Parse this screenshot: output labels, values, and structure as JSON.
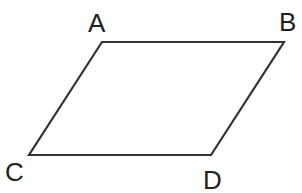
{
  "diagram": {
    "type": "parallelogram",
    "stroke_color": "#333333",
    "label_color": "#222222",
    "vertices": [
      {
        "name": "A",
        "x": 102,
        "y": 42,
        "label_x": 88,
        "label_y": 32
      },
      {
        "name": "B",
        "x": 284,
        "y": 42,
        "label_x": 279,
        "label_y": 31
      },
      {
        "name": "D",
        "x": 211,
        "y": 155,
        "label_x": 203,
        "label_y": 189
      },
      {
        "name": "C",
        "x": 29,
        "y": 155,
        "label_x": 5,
        "label_y": 181
      }
    ],
    "edges": [
      [
        "A",
        "B"
      ],
      [
        "B",
        "D"
      ],
      [
        "D",
        "C"
      ],
      [
        "C",
        "A"
      ]
    ]
  }
}
